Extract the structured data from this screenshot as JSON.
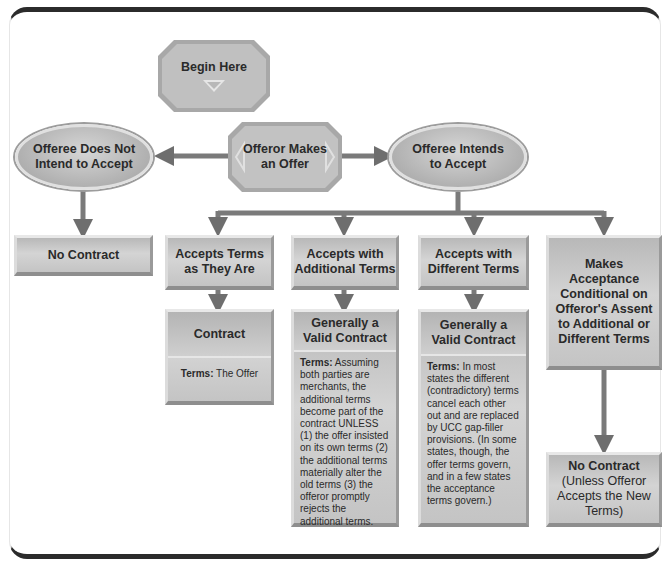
{
  "start": {
    "label": "Begin Here"
  },
  "offer": {
    "label_line1": "Offeror Makes",
    "label_line2": "an Offer"
  },
  "no_accept": {
    "label_line1": "Offeree Does Not",
    "label_line2": "Intend to Accept"
  },
  "accept": {
    "label_line1": "Offeree Intends",
    "label_line2": "to Accept"
  },
  "no_contract": {
    "label": "No Contract"
  },
  "branches": [
    {
      "label_line1": "Accepts Terms",
      "label_line2": "as They Are",
      "result_line1": "Contract",
      "result_line2": "",
      "terms_label": "Terms:",
      "terms_text": " The Offer"
    },
    {
      "label_line1": "Accepts with",
      "label_line2": "Additional Terms",
      "result_line1": "Generally a",
      "result_line2": "Valid Contract",
      "terms_label": "Terms:",
      "terms_text": " Assuming both parties are merchants, the additional terms become part of the contract UNLESS (1) the offer insisted on its own terms (2) the additional terms materially alter the old terms (3) the offeror promptly rejects the additional terms."
    },
    {
      "label_line1": "Accepts with",
      "label_line2": "Different Terms",
      "result_line1": "Generally a",
      "result_line2": "Valid Contract",
      "terms_label": "Terms:",
      "terms_text": " In most states the different (contradictory) terms cancel each other out and are replaced by UCC gap-filler provisions. (In some states, though, the offer terms govern, and in a few states the acceptance terms govern.)"
    },
    {
      "label": "Makes Acceptance Conditional on Offeror's Assent to Additional or Different Terms",
      "result_line1": "No Contract",
      "result_line2": "(Unless Offeror Accepts the New Terms)"
    }
  ],
  "colors": {
    "box": "#c4c4c4",
    "arrow": "#6e6e6e",
    "frame": "#2b2b2b"
  }
}
